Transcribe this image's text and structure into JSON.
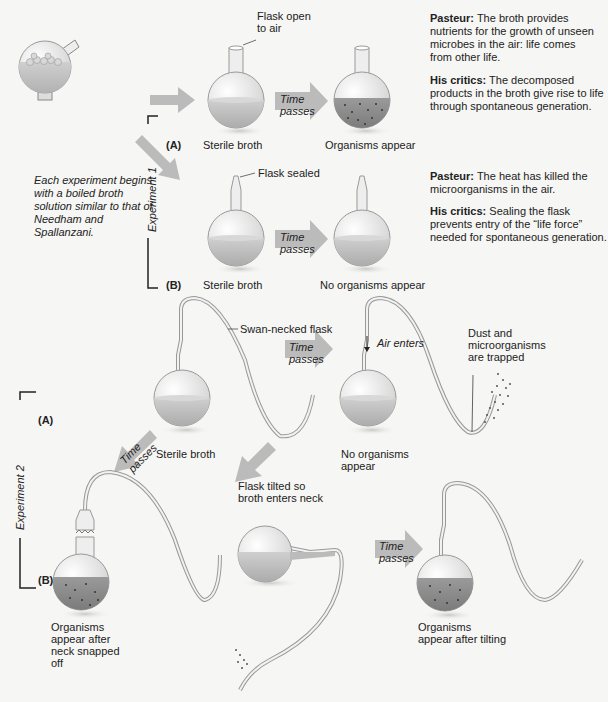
{
  "intro": {
    "caption": "Each experiment begins with a boiled broth solution similar to that of Needham and Spallanzani."
  },
  "experiment1": {
    "label": "Experiment 1",
    "partA": {
      "tag": "(A)",
      "flask_note": "Flask open to air",
      "time_label": "Time passes",
      "before": "Sterile broth",
      "after": "Organisms appear",
      "pasteur_head": "Pasteur:",
      "pasteur_text": "The broth provides nutrients for the growth of unseen microbes in the air: life comes from other life.",
      "critics_head": "His critics:",
      "critics_text": "The decomposed products in the broth give rise to life through spontaneous generation."
    },
    "partB": {
      "tag": "(B)",
      "flask_note": "Flask sealed",
      "time_label": "Time passes",
      "before": "Sterile broth",
      "after": "No organisms appear",
      "pasteur_head": "Pasteur:",
      "pasteur_text": "The heat has killed the microorganisms in the air.",
      "critics_head": "His critics:",
      "critics_text": "Sealing the flask prevents entry of the “life force” needed for spontaneous generation."
    }
  },
  "experiment2": {
    "label": "Experiment 2",
    "tagA": "(A)",
    "tagB": "(B)",
    "swan_note": "Swan-necked flask",
    "time_label_1": "Time passes",
    "air_enters": "Air enters",
    "dust_note": "Dust and microorganisms are trapped",
    "sterile": "Sterile broth",
    "no_organisms": "No organisms appear",
    "time_label_2": "Time passes",
    "snapped": "Organisms appear after neck snapped off",
    "tilted_note": "Flask tilted so broth enters neck",
    "time_label_3": "Time passes",
    "after_tilting": "Organisms appear after tilting"
  },
  "colors": {
    "background": "#f6f6f4",
    "arrow": "#b9b9b9",
    "broth_clear": "#bdbdbd",
    "broth_cloudy": "#8f8f8f",
    "glass": "#e8e8e8"
  }
}
